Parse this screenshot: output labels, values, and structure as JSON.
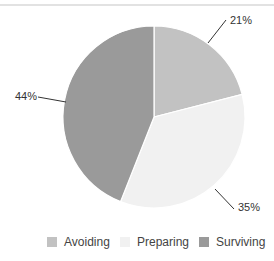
{
  "chart_data": {
    "type": "pie",
    "title": "",
    "categories": [
      "Avoiding",
      "Preparing",
      "Surviving"
    ],
    "values": [
      21,
      35,
      44
    ],
    "labels": [
      "21%",
      "35%",
      "44%"
    ],
    "colors": [
      "#c2c2c2",
      "#f1f1f1",
      "#9a9a9a"
    ],
    "start_angle_deg": 0,
    "direction": "clockwise",
    "legend_position": "bottom-right"
  },
  "legend": {
    "items": [
      {
        "label": "Avoiding",
        "color": "#c2c2c2"
      },
      {
        "label": "Preparing",
        "color": "#f1f1f1"
      },
      {
        "label": "Surviving",
        "color": "#9a9a9a"
      }
    ]
  },
  "annotations": {
    "avoiding": "21%",
    "preparing": "35%",
    "surviving": "44%"
  }
}
